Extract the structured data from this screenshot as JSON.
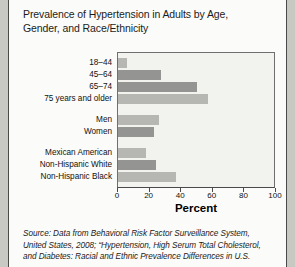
{
  "figure": {
    "title": "Prevalence of Hypertension in Adults by Age, Gender, and Race/Ethnicity",
    "title_line1": "Prevalence of Hypertension in Adults by Age,",
    "title_line2": "Gender, and Race/Ethnicity",
    "source_line1": "Source: Data from Behavioral Risk Factor Surveillance System,",
    "source_line2": "United States, 2008; “Hypertension, High Serum Total Cholesterol,",
    "source_line3": "and Diabetes: Racial and Ethnic Prevalence Differences in U.S."
  },
  "colors": {
    "bar_light": "#b6b6b3",
    "bar_dark": "#949492",
    "plot_background": "#f2f2ef",
    "figure_background": "#fbfbf9",
    "page_background": "#c9c9c4",
    "axis": "#4a4a4a",
    "text": "#111111"
  },
  "chart_data": {
    "type": "bar",
    "orientation": "horizontal",
    "title": "Prevalence of Hypertension in Adults by Age, Gender, and Race/Ethnicity",
    "xlabel": "Percent",
    "ylabel": "",
    "xlim": [
      0,
      100
    ],
    "xticks": [
      0,
      20,
      40,
      60,
      80,
      100
    ],
    "grid": false,
    "legend": "none",
    "groups": [
      {
        "name": "Age",
        "categories": [
          "18–44",
          "45–64",
          "65–74",
          "75 years and older"
        ],
        "values": [
          6,
          27,
          50,
          57
        ]
      },
      {
        "name": "Gender",
        "categories": [
          "Men",
          "Women"
        ],
        "values": [
          26,
          23
        ]
      },
      {
        "name": "Race/Ethnicity",
        "categories": [
          "Mexican American",
          "Non-Hispanic White",
          "Non-Hispanic Black"
        ],
        "values": [
          18,
          24,
          37
        ]
      }
    ],
    "categories": [
      "18–44",
      "45–64",
      "65–74",
      "75 years and older",
      "Men",
      "Women",
      "Mexican American",
      "Non-Hispanic White",
      "Non-Hispanic Black"
    ],
    "values": [
      6,
      27,
      50,
      57,
      26,
      23,
      18,
      24,
      37
    ],
    "bar_shades": [
      "#b6b6b3",
      "#949492",
      "#949492",
      "#b6b6b3",
      "#b6b6b3",
      "#949492",
      "#b6b6b3",
      "#949492",
      "#b6b6b3"
    ]
  }
}
